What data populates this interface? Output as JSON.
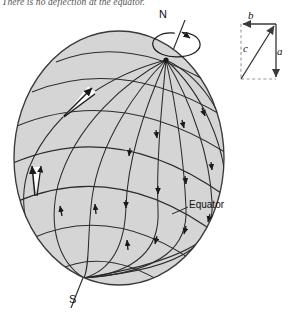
{
  "figure": {
    "title_note": "There is no deflection at the equator.",
    "type": "coriolis-deflection-globe-diagram",
    "background_color": "#ffffff",
    "globe": {
      "fill_color": "#d5d5d5",
      "outline_color": "#3a3a3a",
      "graticule_color": "#2b2b2b",
      "center_x": 119,
      "center_y": 158,
      "radius_x": 105,
      "radius_y": 127,
      "meridian_count": 9,
      "parallel_count": 7
    },
    "labels": {
      "north_pole": "N",
      "south_pole": "S",
      "equator": "Equator"
    },
    "rotation_arrow": {
      "name": "earth-rotation-direction",
      "description": "counterclockwise ellipse around polar axis"
    },
    "deflection_wedges": [
      {
        "name": "deflection-wedge-upper-left",
        "fill": "#ffffff"
      },
      {
        "name": "deflection-wedge-lower-left",
        "fill": "#ffffff"
      }
    ],
    "vector_triangle": {
      "name": "vector-component-triangle",
      "labels": {
        "a": "a",
        "b": "b",
        "c": "c"
      },
      "solid_edges": [
        "b",
        "a",
        "c"
      ],
      "dashed_edges": [
        "left",
        "bottom"
      ],
      "stroke_color": "#3a3a3a",
      "dash_color": "#9a9a9a"
    }
  }
}
